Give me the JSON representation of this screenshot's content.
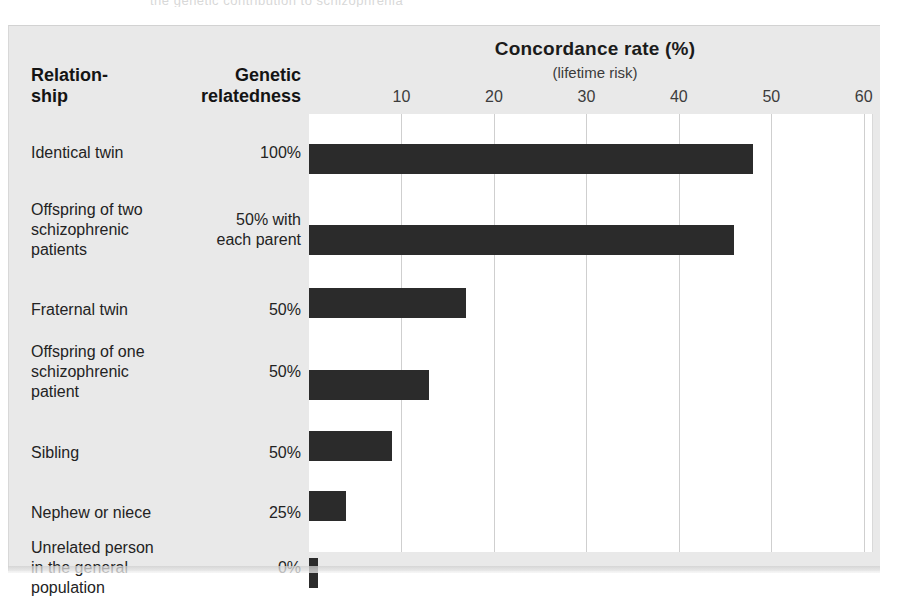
{
  "page": {
    "top_sliver_text": "the genetic contribution to schizophrenia"
  },
  "chart": {
    "title": "Concordance rate (%)",
    "subtitle": "(lifetime risk)",
    "column_headers": {
      "relationship": "Relation-\nship",
      "relationship_line1": "Relation-",
      "relationship_line2": "ship",
      "genetic_relatedness": "Genetic\nrelatedness",
      "relatedness_line1": "Genetic",
      "relatedness_line2": "relatedness"
    },
    "colors": {
      "bar": "#2b2b2b",
      "figure_background": "#e9e9e9",
      "plot_background": "#ffffff",
      "gridline": "#cfcfcf"
    }
  },
  "chart_data": {
    "type": "bar",
    "orientation": "horizontal",
    "title": "Concordance rate (%)",
    "subtitle": "(lifetime risk)",
    "xlabel": "Concordance rate (%)",
    "ylabel": "Relationship",
    "xlim": [
      0,
      61
    ],
    "xticks": [
      10,
      20,
      30,
      40,
      50,
      60
    ],
    "xtick_labels": [
      "10",
      "20",
      "30",
      "40",
      "50",
      "60"
    ],
    "grid": "vertical",
    "legend": "none",
    "categories": [
      "Identical twin",
      "Offspring of two schizophrenic patients",
      "Fraternal twin",
      "Offspring of one schizophrenic patient",
      "Sibling",
      "Nephew or niece",
      "Unrelated person in the general population"
    ],
    "values": [
      48,
      46,
      17,
      13,
      9,
      4,
      1
    ],
    "genetic_relatedness": [
      "100%",
      "50% with each parent",
      "50%",
      "50%",
      "25%",
      "0%"
    ],
    "rows": [
      {
        "label": "Identical twin",
        "label_lines": [
          "Identical twin"
        ],
        "relatedness": "100%",
        "relatedness_lines": [
          "100%"
        ],
        "value": 48
      },
      {
        "label": "Offspring of two schizophrenic patients",
        "label_lines": [
          "Offspring of two",
          "schizophrenic",
          "patients"
        ],
        "relatedness": "50% with each parent",
        "relatedness_lines": [
          "50% with",
          "each parent"
        ],
        "value": 46
      },
      {
        "label": "Fraternal twin",
        "label_lines": [
          "Fraternal twin"
        ],
        "relatedness": "50%",
        "relatedness_lines": [
          "50%"
        ],
        "value": 17
      },
      {
        "label": "Offspring of one schizophrenic patient",
        "label_lines": [
          "Offspring of one",
          "schizophrenic",
          "patient"
        ],
        "relatedness": "50%",
        "relatedness_lines": [
          "50%"
        ],
        "value": 13
      },
      {
        "label": "Sibling",
        "label_lines": [
          "Sibling"
        ],
        "relatedness": "50%",
        "relatedness_lines": [
          "50%"
        ],
        "value": 9
      },
      {
        "label": "Nephew or niece",
        "label_lines": [
          "Nephew or niece"
        ],
        "relatedness": "25%",
        "relatedness_lines": [
          "25%"
        ],
        "value": 4
      },
      {
        "label": "Unrelated person in the general population",
        "label_lines": [
          "Unrelated person",
          "in the general",
          "population"
        ],
        "relatedness": "0%",
        "relatedness_lines": [
          "0%"
        ],
        "value": 1
      }
    ]
  }
}
